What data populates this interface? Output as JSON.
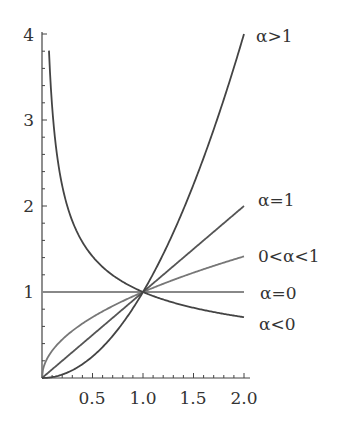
{
  "chart_data": {
    "type": "line",
    "title": "",
    "xlabel": "",
    "ylabel": "",
    "xlim": [
      0,
      2.0
    ],
    "ylim": [
      0,
      4
    ],
    "grid": false,
    "x_ticks": [
      "0.5",
      "1.0",
      "1.5",
      "2.0"
    ],
    "y_ticks": [
      "1",
      "2",
      "3",
      "4"
    ],
    "function": "y = x^alpha",
    "series": [
      {
        "name": "α>1",
        "alpha": 2,
        "color": "#444444"
      },
      {
        "name": "α=1",
        "alpha": 1,
        "color": "#555555"
      },
      {
        "name": "0<α<1",
        "alpha": 0.5,
        "color": "#777777"
      },
      {
        "name": "α=0",
        "alpha": 0,
        "color": "#888888"
      },
      {
        "name": "α<0",
        "alpha": -0.5,
        "color": "#444444"
      }
    ],
    "annotations": [
      "α>1",
      "α=1",
      "0<α<1",
      "α=0",
      "α<0"
    ]
  },
  "labels": {
    "x": {
      "t1": "0.5",
      "t2": "1.0",
      "t3": "1.5",
      "t4": "2.0"
    },
    "y": {
      "t1": "1",
      "t2": "2",
      "t3": "3",
      "t4": "4"
    },
    "curves": {
      "gt1": "α>1",
      "eq1": "α=1",
      "between": "0<α<1",
      "eq0": "α=0",
      "lt0": "α<0"
    }
  }
}
